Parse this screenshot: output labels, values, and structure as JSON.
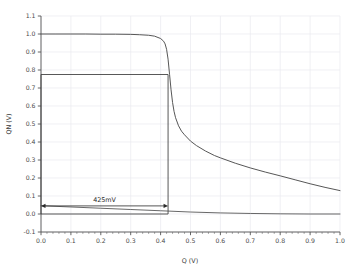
{
  "figure": {
    "background": "#ffffff",
    "axis_color": "#555555",
    "grid_color": "#e9e9ef",
    "curve_color": "#4d4d4d",
    "box_color": "#3a3a3a",
    "annotation_color": "#2b2b2b"
  },
  "chart_data": {
    "type": "line",
    "title": "",
    "xlabel": "Q (V)",
    "ylabel": "QN (V)",
    "xlim": [
      0.0,
      1.0
    ],
    "ylim": [
      -0.1,
      1.1
    ],
    "grid": true,
    "legend": null,
    "xticks": [
      "0.0",
      "0.1",
      "0.2",
      "0.3",
      "0.4",
      "0.5",
      "0.6",
      "0.7",
      "0.8",
      "0.9",
      "1.0"
    ],
    "xtick_values": [
      0.0,
      0.1,
      0.2,
      0.3,
      0.4,
      0.5,
      0.6,
      0.7,
      0.8,
      0.9,
      1.0
    ],
    "yticks": [
      "1.1",
      "1.0",
      "0.9",
      "0.8",
      "0.7",
      "0.6",
      "0.5",
      "0.4",
      "0.3",
      "0.2",
      "0.1",
      "0.0",
      "-0.1"
    ],
    "ytick_values": [
      1.1,
      1.0,
      0.9,
      0.8,
      0.7,
      0.6,
      0.5,
      0.4,
      0.3,
      0.2,
      0.1,
      0.0,
      -0.1
    ],
    "series": [
      {
        "name": "QN vs Q (inverter transfer curve)",
        "x": [
          0.0,
          0.05,
          0.1,
          0.15,
          0.2,
          0.25,
          0.3,
          0.33,
          0.36,
          0.38,
          0.4,
          0.41,
          0.415,
          0.42,
          0.425,
          0.43,
          0.435,
          0.44,
          0.445,
          0.45,
          0.46,
          0.47,
          0.48,
          0.5,
          0.52,
          0.55,
          0.58,
          0.6,
          0.65,
          0.7,
          0.75,
          0.8,
          0.85,
          0.9,
          0.95,
          1.0
        ],
        "values": [
          1.0,
          1.0,
          1.0,
          1.0,
          0.999,
          0.999,
          0.998,
          0.996,
          0.993,
          0.988,
          0.975,
          0.96,
          0.945,
          0.915,
          0.86,
          0.775,
          0.69,
          0.62,
          0.57,
          0.535,
          0.49,
          0.46,
          0.44,
          0.405,
          0.38,
          0.35,
          0.325,
          0.312,
          0.282,
          0.256,
          0.233,
          0.212,
          0.19,
          0.168,
          0.148,
          0.13
        ]
      },
      {
        "name": "lower branch",
        "x": [
          0.0,
          0.1,
          0.2,
          0.3,
          0.4,
          0.5,
          0.6,
          0.7,
          0.8,
          0.9,
          1.0
        ],
        "values": [
          0.046,
          0.039,
          0.032,
          0.025,
          0.018,
          0.011,
          0.006,
          0.003,
          0.001,
          0.0,
          0.0
        ]
      }
    ],
    "annotations": [
      {
        "type": "noise-margin-box",
        "x0": 0.0,
        "x1": 0.425,
        "y0": 0.0,
        "y1": 0.775
      },
      {
        "type": "double-arrow",
        "label": "425mV",
        "x0": 0.0,
        "x1": 0.425,
        "y": 0.045
      }
    ]
  },
  "labels": {
    "annotation_text": "425mV",
    "x_axis_title": "Q (V)",
    "y_axis_title": "QN (V)"
  }
}
